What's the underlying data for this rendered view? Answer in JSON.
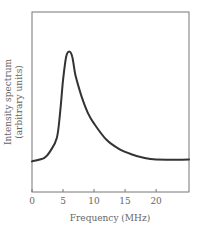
{
  "chart_data": {
    "type": "line",
    "title": "",
    "xlabel": "Frequency (MHz)",
    "ylabel_lines": [
      "Intensity spectrum",
      "(arbitrary units)"
    ],
    "ylabel": "Intensity spectrum (arbitrary units)",
    "xlim": [
      0,
      25.3
    ],
    "ylim": [
      0,
      1
    ],
    "x_ticks": [
      0,
      5,
      10,
      15,
      20
    ],
    "x_tick_labels": [
      "0",
      "5",
      "10",
      "15",
      "20"
    ],
    "y_ticks": [],
    "grid": false,
    "legend": null,
    "series": [
      {
        "name": "Intensity spectrum",
        "color": "#333333",
        "x": [
          0,
          2,
          3,
          4,
          4.5,
          5,
          5.5,
          6,
          6.5,
          7,
          8,
          9,
          10,
          12,
          14,
          16,
          18,
          20,
          25.3
        ],
        "y": [
          0.17,
          0.19,
          0.23,
          0.3,
          0.43,
          0.62,
          0.75,
          0.78,
          0.75,
          0.65,
          0.53,
          0.44,
          0.38,
          0.29,
          0.24,
          0.21,
          0.19,
          0.18,
          0.18
        ]
      }
    ],
    "annotations": []
  },
  "colors": {
    "frame": "#777777",
    "curve": "#333333",
    "text": "#666666"
  }
}
